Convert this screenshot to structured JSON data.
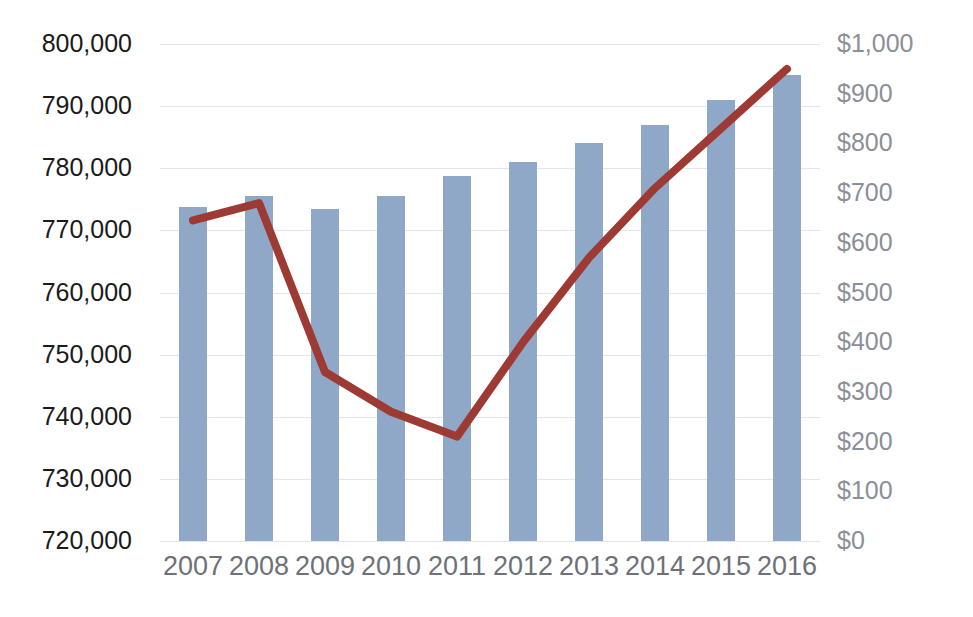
{
  "chart_data": {
    "type": "bar",
    "title": "",
    "xlabel": "",
    "categories": [
      "2007",
      "2008",
      "2009",
      "2010",
      "2011",
      "2012",
      "2013",
      "2014",
      "2015",
      "2016"
    ],
    "series": [
      {
        "name": "bars",
        "kind": "bar",
        "axis": "left",
        "values": [
          773700,
          775500,
          773500,
          775500,
          778800,
          781000,
          784000,
          787000,
          791000,
          795000
        ],
        "color": "#8fa8c8"
      },
      {
        "name": "line",
        "kind": "line",
        "axis": "right",
        "values": [
          645,
          680,
          340,
          260,
          210,
          400,
          570,
          710,
          830,
          950
        ],
        "color": "#9e3a34"
      }
    ],
    "left_axis": {
      "label": "",
      "ylim": [
        720000,
        800000
      ],
      "tick_step": 10000,
      "tick_labels": [
        "800,000",
        "790,000",
        "780,000",
        "770,000",
        "760,000",
        "750,000",
        "740,000",
        "730,000",
        "720,000"
      ],
      "tick_values": [
        800000,
        790000,
        780000,
        770000,
        760000,
        750000,
        740000,
        730000,
        720000
      ],
      "text_color": "#1a1a1a"
    },
    "right_axis": {
      "label": "",
      "ylim": [
        0,
        1000
      ],
      "tick_step": 100,
      "tick_labels": [
        "$1,000",
        "$900",
        "$800",
        "$700",
        "$600",
        "$500",
        "$400",
        "$300",
        "$200",
        "$100",
        "$0"
      ],
      "tick_values": [
        1000,
        900,
        800,
        700,
        600,
        500,
        400,
        300,
        200,
        100,
        0
      ],
      "text_color": "#8b8f96"
    },
    "grid": true,
    "legend": "none",
    "x_tick_color": "#6d7178"
  },
  "colors": {
    "bar": "#8fa8c8",
    "line": "#9e3a34",
    "background": "#ffffff",
    "gridline": "rgba(120,140,170,0.22)"
  }
}
